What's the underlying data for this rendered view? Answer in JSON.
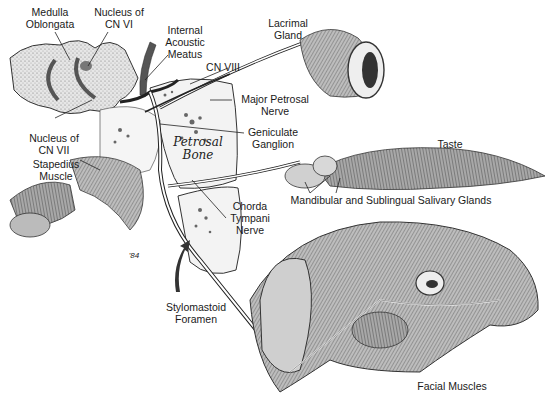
{
  "diagram": {
    "colors": {
      "background": "#ffffff",
      "ink": "#1a1a1a",
      "shade": "#9a9a9a",
      "bone": "#f4f4f4"
    },
    "labels": {
      "medulla_oblongata": "Medulla\nOblongata",
      "nucleus_cn_vi": "Nucleus of\nCN VI",
      "internal_acoustic_meatus": "Internal\nAcoustic\nMeatus",
      "cn_viii": "CN VIII",
      "lacrimal_gland": "Lacrimal\nGland",
      "major_petrosal_nerve": "Major Petrosal\nNerve",
      "geniculate_ganglion": "Geniculate\nGanglion",
      "petrosal_bone": "Petrosal\nBone",
      "nucleus_cn_vii": "Nucleus of\nCN VII",
      "stapedius_muscle": "Stapedius\nMuscle",
      "taste": "Taste",
      "salivary_glands": "Mandibular and Sublingual Salivary Glands",
      "chorda_tympani_nerve": "Chorda\nTympani\nNerve",
      "stylomastoid_foramen": "Stylomastoid\nForamen",
      "facial_muscles": "Facial Muscles",
      "signature": "'84"
    }
  }
}
